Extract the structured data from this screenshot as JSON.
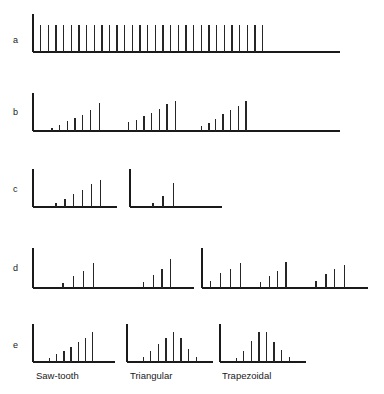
{
  "figure": {
    "title": "",
    "row_labels": [
      "a",
      "b",
      "c",
      "d",
      "e"
    ],
    "column_labels": [
      "Saw-tooth",
      "Triangular",
      "Trapezoidal"
    ],
    "background_color": "#ffffff",
    "line_color": "#262626",
    "axis_color": "#1a1a1a"
  },
  "chart_data": {
    "type": "bar",
    "title": "",
    "xlabel": "",
    "ylabel": "",
    "grid": false,
    "legend": "none",
    "ylim": [
      0,
      1
    ],
    "panels": [
      {
        "row": "a",
        "name": "row-a-comb",
        "groups": [
          {
            "name": "uniform-comb",
            "label": "",
            "x": [
              0.03,
              0.06,
              0.09,
              0.12,
              0.15,
              0.18,
              0.21,
              0.24,
              0.27,
              0.3,
              0.33,
              0.36,
              0.39,
              0.42,
              0.45,
              0.48,
              0.51,
              0.54,
              0.57,
              0.6,
              0.63,
              0.66,
              0.69,
              0.72,
              0.75,
              0.78,
              0.81,
              0.84,
              0.87,
              0.9
            ],
            "values": [
              0.72,
              0.72,
              0.72,
              0.72,
              0.72,
              0.72,
              0.72,
              0.72,
              0.72,
              0.72,
              0.72,
              0.72,
              0.72,
              0.72,
              0.72,
              0.72,
              0.72,
              0.72,
              0.72,
              0.72,
              0.72,
              0.72,
              0.72,
              0.72,
              0.72,
              0.72,
              0.72,
              0.72,
              0.72,
              0.72
            ]
          }
        ]
      },
      {
        "row": "b",
        "name": "row-b-spectra",
        "groups": [
          {
            "name": "group-b-1",
            "label": "",
            "x": [
              0.075,
              0.105,
              0.135,
              0.165,
              0.195,
              0.225,
              0.26
            ],
            "values": [
              0.07,
              0.16,
              0.26,
              0.33,
              0.43,
              0.56,
              0.74
            ]
          },
          {
            "name": "group-b-2",
            "label": "",
            "x": [
              0.375,
              0.405,
              0.435,
              0.465,
              0.495,
              0.525,
              0.56
            ],
            "values": [
              0.23,
              0.3,
              0.4,
              0.48,
              0.57,
              0.7,
              0.8
            ]
          },
          {
            "name": "group-b-3",
            "label": "",
            "x": [
              0.66,
              0.69,
              0.715,
              0.745,
              0.775,
              0.805,
              0.835
            ],
            "values": [
              0.12,
              0.22,
              0.32,
              0.44,
              0.54,
              0.67,
              0.8
            ]
          }
        ]
      },
      {
        "row": "c",
        "name": "row-c-spectra",
        "groups": [
          {
            "name": "group-c-1",
            "label": "",
            "x": [
              0.09,
              0.125,
              0.16,
              0.195,
              0.23,
              0.265
            ],
            "values": [
              0.1,
              0.22,
              0.33,
              0.45,
              0.6,
              0.7
            ]
          },
          {
            "name": "group-c-2",
            "label": "",
            "x": [
              0.42,
              0.46,
              0.5
            ],
            "values": [
              0.1,
              0.3,
              0.62
            ]
          }
        ]
      },
      {
        "row": "d",
        "name": "row-d-spectra",
        "groups": [
          {
            "name": "group-d-1",
            "label": "",
            "x": [
              0.09,
              0.12,
              0.15,
              0.18
            ],
            "values": [
              0.13,
              0.3,
              0.42,
              0.62
            ]
          },
          {
            "name": "group-d-2",
            "label": "",
            "x": [
              0.33,
              0.36,
              0.385,
              0.41
            ],
            "values": [
              0.15,
              0.32,
              0.48,
              0.72
            ]
          },
          {
            "name": "group-d-3",
            "label": "",
            "x": [
              0.53,
              0.56,
              0.59,
              0.62
            ],
            "values": [
              0.18,
              0.38,
              0.48,
              0.62
            ]
          },
          {
            "name": "group-d-4",
            "label": "",
            "x": [
              0.68,
              0.705,
              0.73,
              0.755
            ],
            "values": [
              0.14,
              0.3,
              0.42,
              0.66
            ]
          },
          {
            "name": "group-d-5",
            "label": "",
            "x": [
              0.845,
              0.875,
              0.9,
              0.93
            ],
            "values": [
              0.17,
              0.35,
              0.48,
              0.58
            ]
          }
        ]
      },
      {
        "row": "e",
        "name": "row-e-spectra",
        "groups": [
          {
            "name": "group-e-saw-tooth",
            "label": "Saw-tooth",
            "x": [
              0.08,
              0.115,
              0.15,
              0.185,
              0.22,
              0.255,
              0.29
            ],
            "values": [
              0.1,
              0.2,
              0.3,
              0.4,
              0.52,
              0.62,
              0.78
            ]
          },
          {
            "name": "group-e-triangular",
            "label": "Triangular",
            "x": [
              0.075,
              0.11,
              0.145,
              0.18,
              0.215,
              0.25,
              0.285,
              0.32
            ],
            "values": [
              0.12,
              0.28,
              0.48,
              0.62,
              0.8,
              0.62,
              0.35,
              0.12
            ]
          },
          {
            "name": "group-e-trapezoidal",
            "label": "Trapezoidal",
            "x": [
              0.075,
              0.11,
              0.145,
              0.18,
              0.215,
              0.25,
              0.285,
              0.32
            ],
            "values": [
              0.1,
              0.28,
              0.56,
              0.8,
              0.78,
              0.52,
              0.32,
              0.12
            ]
          }
        ]
      }
    ]
  }
}
